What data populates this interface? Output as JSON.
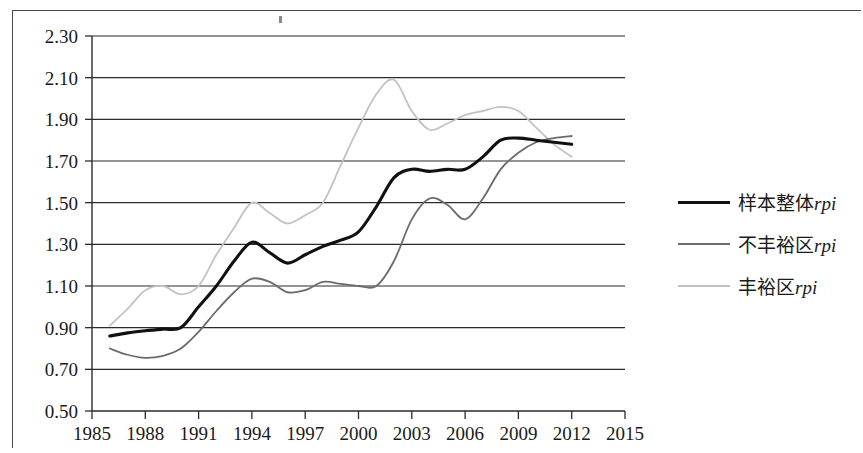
{
  "chart_data": {
    "type": "line",
    "title": "",
    "subtitle": "",
    "xlabel": "",
    "ylabel": "",
    "xlim": [
      1985,
      2015
    ],
    "ylim": [
      0.5,
      2.3
    ],
    "grid": true,
    "legend_position": "right",
    "x_ticks": [
      "1985",
      "1988",
      "1991",
      "1994",
      "1997",
      "2000",
      "2003",
      "2006",
      "2009",
      "2012",
      "2015"
    ],
    "y_ticks": [
      "0.50",
      "0.70",
      "0.90",
      "1.10",
      "1.30",
      "1.50",
      "1.70",
      "1.90",
      "2.10",
      "2.30"
    ],
    "series": [
      {
        "name": "样本整体rpi",
        "name_cn": "样本整体",
        "name_suffix": "rpi",
        "color": "#111111",
        "width": 3.1,
        "x": [
          1986,
          1987,
          1988,
          1989,
          1990,
          1991,
          1992,
          1993,
          1994,
          1995,
          1996,
          1997,
          1998,
          1999,
          2000,
          2001,
          2002,
          2003,
          2004,
          2005,
          2006,
          2007,
          2008,
          2009,
          2010,
          2011,
          2012
        ],
        "values": [
          0.86,
          0.875,
          0.885,
          0.893,
          0.9,
          1.0,
          1.1,
          1.22,
          1.31,
          1.26,
          1.21,
          1.25,
          1.29,
          1.32,
          1.36,
          1.48,
          1.62,
          1.66,
          1.65,
          1.66,
          1.66,
          1.72,
          1.8,
          1.81,
          1.8,
          1.79,
          1.78
        ]
      },
      {
        "name": "不丰裕区rpi",
        "name_cn": "不丰裕区",
        "name_suffix": "rpi",
        "color": "#6b6b6b",
        "width": 1.8,
        "x": [
          1986,
          1987,
          1988,
          1989,
          1990,
          1991,
          1992,
          1993,
          1994,
          1995,
          1996,
          1997,
          1998,
          1999,
          2000,
          2001,
          2002,
          2003,
          2004,
          2005,
          2006,
          2007,
          2008,
          2009,
          2010,
          2011,
          2012
        ],
        "values": [
          0.8,
          0.77,
          0.755,
          0.765,
          0.8,
          0.88,
          0.98,
          1.07,
          1.135,
          1.12,
          1.07,
          1.08,
          1.12,
          1.11,
          1.1,
          1.1,
          1.22,
          1.42,
          1.52,
          1.49,
          1.42,
          1.52,
          1.66,
          1.74,
          1.79,
          1.81,
          1.82
        ]
      },
      {
        "name": "丰裕区rpi",
        "name_cn": "丰裕区",
        "name_suffix": "rpi",
        "color": "#c2c2c2",
        "width": 1.8,
        "x": [
          1986,
          1987,
          1988,
          1989,
          1990,
          1991,
          1992,
          1993,
          1994,
          1995,
          1996,
          1997,
          1998,
          1999,
          2000,
          2001,
          2002,
          2003,
          2004,
          2005,
          2006,
          2007,
          2008,
          2009,
          2010,
          2011,
          2012
        ],
        "values": [
          0.91,
          0.99,
          1.08,
          1.1,
          1.06,
          1.1,
          1.25,
          1.38,
          1.5,
          1.45,
          1.4,
          1.44,
          1.5,
          1.68,
          1.86,
          2.02,
          2.09,
          1.94,
          1.85,
          1.88,
          1.92,
          1.94,
          1.96,
          1.94,
          1.86,
          1.78,
          1.72
        ]
      }
    ]
  },
  "legend": {
    "items": [
      {
        "label": "样本整体",
        "suffix": "rpi",
        "style": "thick-solid"
      },
      {
        "label": "不丰裕区",
        "suffix": "rpi",
        "style": "medium-solid"
      },
      {
        "label": "丰裕区",
        "suffix": "rpi",
        "style": "light-solid"
      }
    ]
  }
}
